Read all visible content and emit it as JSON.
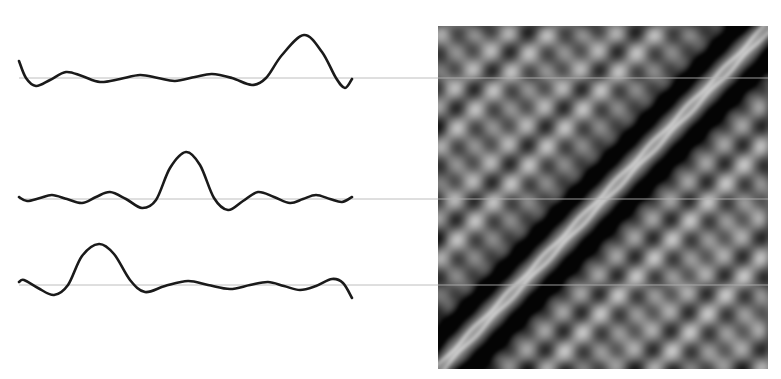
{
  "figure": {
    "colors": {
      "background": "#ffffff",
      "curve": "#1a1a1a",
      "baseline": "#b4b4b4",
      "heatmap_dark": "#0a0a0a",
      "heatmap_mid": "#7a7a7a",
      "heatmap_light": "#e8e8e8"
    }
  },
  "waveforms": [
    {
      "name": "waveform-1",
      "baseline_y": 78,
      "baseline_x_start": 19,
      "baseline_x_end": 768,
      "points": [
        [
          19,
          61
        ],
        [
          26,
          78
        ],
        [
          36,
          86
        ],
        [
          50,
          80
        ],
        [
          66,
          72
        ],
        [
          82,
          76
        ],
        [
          100,
          82
        ],
        [
          120,
          79
        ],
        [
          140,
          75
        ],
        [
          158,
          78
        ],
        [
          175,
          81
        ],
        [
          195,
          77
        ],
        [
          212,
          74
        ],
        [
          232,
          78
        ],
        [
          252,
          85
        ],
        [
          266,
          78
        ],
        [
          282,
          55
        ],
        [
          304,
          35
        ],
        [
          322,
          52
        ],
        [
          336,
          78
        ],
        [
          345,
          88
        ],
        [
          352,
          79
        ]
      ],
      "peak_x": 304
    },
    {
      "name": "waveform-2",
      "baseline_y": 199,
      "baseline_x_start": 19,
      "baseline_x_end": 768,
      "points": [
        [
          19,
          197
        ],
        [
          27,
          201
        ],
        [
          40,
          198
        ],
        [
          52,
          195
        ],
        [
          67,
          199
        ],
        [
          82,
          203
        ],
        [
          96,
          197
        ],
        [
          110,
          192
        ],
        [
          126,
          199
        ],
        [
          142,
          208
        ],
        [
          156,
          200
        ],
        [
          170,
          168
        ],
        [
          186,
          152
        ],
        [
          200,
          165
        ],
        [
          214,
          198
        ],
        [
          228,
          210
        ],
        [
          243,
          201
        ],
        [
          258,
          192
        ],
        [
          274,
          197
        ],
        [
          290,
          203
        ],
        [
          303,
          199
        ],
        [
          316,
          195
        ],
        [
          330,
          199
        ],
        [
          342,
          202
        ],
        [
          352,
          197
        ]
      ],
      "peak_x": 186
    },
    {
      "name": "waveform-3",
      "baseline_y": 285,
      "baseline_x_start": 19,
      "baseline_x_end": 768,
      "points": [
        [
          19,
          282
        ],
        [
          24,
          280
        ],
        [
          38,
          288
        ],
        [
          54,
          295
        ],
        [
          68,
          285
        ],
        [
          82,
          256
        ],
        [
          99,
          244
        ],
        [
          114,
          254
        ],
        [
          130,
          280
        ],
        [
          145,
          292
        ],
        [
          165,
          286
        ],
        [
          188,
          281
        ],
        [
          208,
          285
        ],
        [
          230,
          289
        ],
        [
          250,
          285
        ],
        [
          268,
          282
        ],
        [
          284,
          286
        ],
        [
          300,
          290
        ],
        [
          316,
          286
        ],
        [
          332,
          279
        ],
        [
          343,
          283
        ],
        [
          352,
          298
        ]
      ],
      "peak_x": 99
    }
  ],
  "heatmap": {
    "name": "gram-matrix",
    "x": 438,
    "y": 26,
    "width": 330,
    "height": 343,
    "diagonal": "bottom-left to top-right",
    "pattern": "bright main diagonal band with beaded ridges, flanked by dark bands and a lattice of light/dark blobs"
  }
}
